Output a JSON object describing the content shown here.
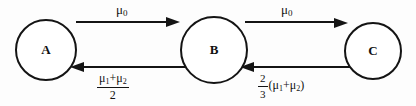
{
  "figure": {
    "type": "state-transition-diagram",
    "background_color": "#fdfdfd",
    "stroke_color": "#141414",
    "nodes": [
      {
        "id": "A",
        "label": "A",
        "cx": 46,
        "cy": 50,
        "r": 30
      },
      {
        "id": "B",
        "label": "B",
        "cx": 214,
        "cy": 50,
        "r": 33
      },
      {
        "id": "C",
        "label": "C",
        "cx": 373,
        "cy": 51,
        "r": 28
      }
    ],
    "edges": [
      {
        "id": "a-to-b",
        "from": "A",
        "to": "B",
        "direction": "right",
        "label_text": "μ0",
        "label_position": "above"
      },
      {
        "id": "b-to-c",
        "from": "B",
        "to": "C",
        "direction": "right",
        "label_text": "μ0",
        "label_position": "above"
      },
      {
        "id": "b-to-a",
        "from": "B",
        "to": "A",
        "direction": "left",
        "label_text": "(μ1+μ2)/2",
        "label_position": "below"
      },
      {
        "id": "c-to-b",
        "from": "C",
        "to": "B",
        "direction": "left",
        "label_text": "(2/3)(μ1+μ2)",
        "label_position": "below"
      }
    ]
  },
  "labels": {
    "mu_left": {
      "base": "μ",
      "sub": "0"
    },
    "mu_right": {
      "base": "μ",
      "sub": "0"
    },
    "frac_left": {
      "numerator_mu1": "μ",
      "numerator_sub1": "1",
      "numerator_plus": "+",
      "numerator_mu2": "μ",
      "numerator_sub2": "2",
      "denominator": "2"
    },
    "frac_right": {
      "numerator": "2",
      "denominator": "3",
      "open_paren": "(",
      "mu1": "μ",
      "sub1": "1",
      "plus": "+",
      "mu2": "μ",
      "sub2": "2",
      "close_paren": ")"
    }
  }
}
